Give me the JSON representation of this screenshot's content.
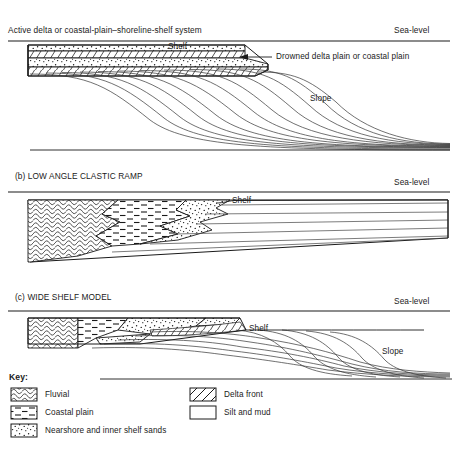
{
  "figure": {
    "type": "geological-cross-section-diagram",
    "width": 458,
    "height": 452,
    "background": "#ffffff",
    "line_color": "#1a1a1a",
    "text_color": "#1a1a1a"
  },
  "panels": [
    {
      "id": "a",
      "title": "Active delta or coastal-plain–shoreline-shelf system",
      "sea_level_label": "Sea-level",
      "inner_labels": [
        {
          "text": "Shelf",
          "x": 168,
          "y": 46
        },
        {
          "text": "Slope",
          "x": 310,
          "y": 98
        }
      ],
      "annotation": {
        "text": "Drowned delta plain or coastal plain",
        "arrow": "left-pointing"
      }
    },
    {
      "id": "b",
      "title": "(b) LOW ANGLE CLASTIC RAMP",
      "sea_level_label": "Sea-level",
      "inner_labels": [
        {
          "text": "Shelf",
          "x": 232,
          "y": 200
        }
      ]
    },
    {
      "id": "c",
      "title": "(c) WIDE SHELF MODEL",
      "sea_level_label": "Sea-level",
      "inner_labels": [
        {
          "text": "Shelf",
          "x": 249,
          "y": 328
        },
        {
          "text": "Slope",
          "x": 382,
          "y": 351
        }
      ]
    }
  ],
  "key": {
    "title": "Key:",
    "items": [
      {
        "label": "Fluvial",
        "pattern": "fluvial-conglomerate",
        "column": "left"
      },
      {
        "label": "Coastal plain",
        "pattern": "coastal-plain-dashes",
        "column": "left"
      },
      {
        "label": "Nearshore and inner shelf sands",
        "pattern": "sand-stipple",
        "column": "left"
      },
      {
        "label": "Delta front",
        "pattern": "delta-front-diagonal",
        "column": "right"
      },
      {
        "label": "Silt and mud",
        "pattern": "blank-white",
        "column": "right"
      }
    ]
  }
}
